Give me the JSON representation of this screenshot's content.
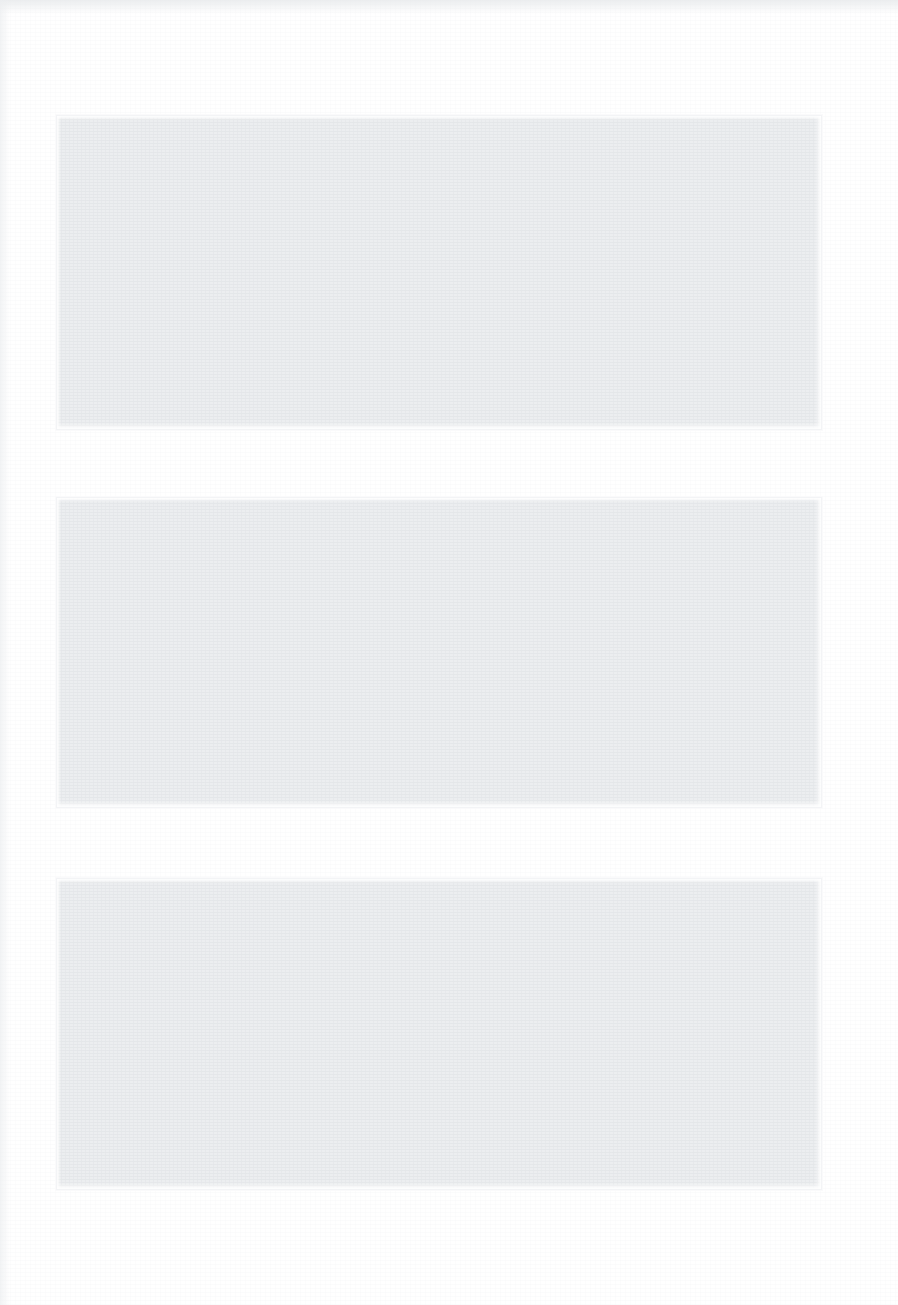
{
  "page": {
    "background_color": "#ffffff",
    "width": 898,
    "height": 1305,
    "visible_text": ""
  },
  "blocks": [
    {
      "name": "content-block-1",
      "label": "",
      "fill_color": "#eceef0",
      "x": 56,
      "y": 115,
      "width": 766,
      "height": 315
    },
    {
      "name": "content-block-2",
      "label": "",
      "fill_color": "#eceef0",
      "x": 56,
      "y": 497,
      "width": 766,
      "height": 311
    },
    {
      "name": "content-block-3",
      "label": "",
      "fill_color": "#eceef0",
      "x": 56,
      "y": 878,
      "width": 766,
      "height": 312
    }
  ]
}
